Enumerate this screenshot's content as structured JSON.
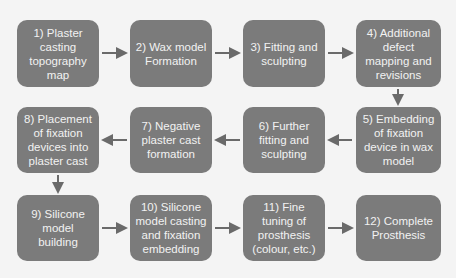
{
  "diagram": {
    "type": "process-flow",
    "colors": {
      "box": "#7b7b7b",
      "text": "#f2f2f2",
      "arrow": "#6a6a6a",
      "background": "#f4f4f4"
    },
    "steps": [
      {
        "label": "1) Plaster casting topography map"
      },
      {
        "label": "2) Wax model Formation"
      },
      {
        "label": "3) Fitting and sculpting"
      },
      {
        "label": "4) Additional defect mapping and revisions"
      },
      {
        "label": "5) Embedding of fixation device in wax model"
      },
      {
        "label": "6) Further fitting and sculpting"
      },
      {
        "label": "7) Negative plaster cast formation"
      },
      {
        "label": "8) Placement of fixation devices into plaster cast"
      },
      {
        "label": "9) Silicone model building"
      },
      {
        "label": "10) Silicone model casting and fixation embedding"
      },
      {
        "label": "11) Fine tuning of prosthesis (colour, etc.)"
      },
      {
        "label": "12) Complete Prosthesis"
      }
    ]
  }
}
